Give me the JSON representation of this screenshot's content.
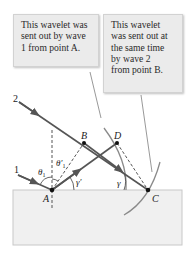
{
  "callouts": [
    {
      "id": "wavelet-a",
      "lines": [
        "This wavelet was",
        "sent out by wave",
        "1 from point A."
      ]
    },
    {
      "id": "wavelet-b",
      "lines": [
        "This wavelet",
        "was sent out at",
        "the same time",
        "by wave 2",
        "from point B."
      ]
    }
  ],
  "rays": {
    "ray1_label": "1",
    "ray2_label": "2"
  },
  "points": {
    "A": "A",
    "B": "B",
    "C": "C",
    "D": "D"
  },
  "angles": {
    "theta1": "θ",
    "theta1_sub": "1",
    "theta1_prime": "θ′",
    "theta1_prime_sub": "1",
    "gamma_prime": "γ′",
    "gamma": "γ"
  },
  "colors": {
    "ray": "#555555",
    "wavefront": "#8a8a8a",
    "surface_fill": "#f0f0f0",
    "surface_border": "#c8c8c8",
    "callout_bg": "#ebebeb",
    "point": "#111111"
  }
}
